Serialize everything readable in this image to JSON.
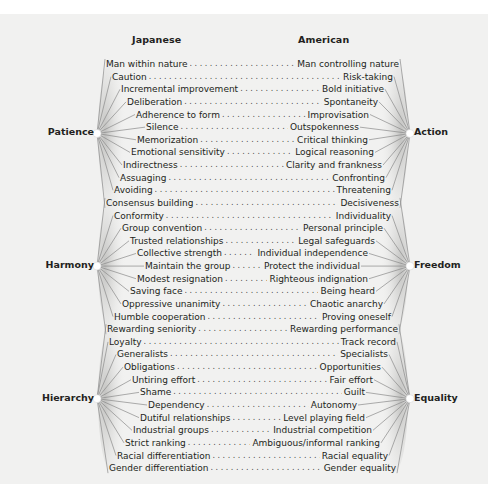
{
  "headers": {
    "left": "Japanese",
    "right": "American"
  },
  "groups": [
    {
      "left": "Patience",
      "right": "Action",
      "rows": [
        0,
        11
      ]
    },
    {
      "left": "Harmony",
      "right": "Freedom",
      "rows": [
        11,
        21
      ]
    },
    {
      "left": "Hierarchy",
      "right": "Equality",
      "rows": [
        21,
        32
      ]
    }
  ],
  "rows": [
    {
      "jp": "Man within nature",
      "us": "Man controlling nature"
    },
    {
      "jp": "Caution",
      "us": "Risk-taking"
    },
    {
      "jp": "Incremental improvement",
      "us": "Bold initiative"
    },
    {
      "jp": "Deliberation",
      "us": "Spontaneity"
    },
    {
      "jp": "Adherence to form",
      "us": "Improvisation"
    },
    {
      "jp": "Silence",
      "us": "Outspokenness"
    },
    {
      "jp": "Memorization",
      "us": "Critical thinking"
    },
    {
      "jp": "Emotional sensitivity",
      "us": "Logical reasoning"
    },
    {
      "jp": "Indirectness",
      "us": "Clarity and frankness"
    },
    {
      "jp": "Assuaging",
      "us": "Confronting"
    },
    {
      "jp": "Avoiding",
      "us": "Threatening"
    },
    {
      "jp": "Consensus building",
      "us": "Decisiveness"
    },
    {
      "jp": "Conformity",
      "us": "Individuality"
    },
    {
      "jp": "Group convention",
      "us": "Personal principle"
    },
    {
      "jp": "Trusted relationships",
      "us": "Legal safeguards"
    },
    {
      "jp": "Collective strength",
      "us": "Individual independence"
    },
    {
      "jp": "Maintain the group",
      "us": "Protect the individual"
    },
    {
      "jp": "Modest resignation",
      "us": "Righteous indignation"
    },
    {
      "jp": "Saving face",
      "us": "Being heard"
    },
    {
      "jp": "Oppressive unanimity",
      "us": "Chaotic anarchy"
    },
    {
      "jp": "Humble cooperation",
      "us": "Proving oneself"
    },
    {
      "jp": "Rewarding seniority",
      "us": "Rewarding performance"
    },
    {
      "jp": "Loyalty",
      "us": "Track record"
    },
    {
      "jp": "Generalists",
      "us": "Specialists"
    },
    {
      "jp": "Obligations",
      "us": "Opportunities"
    },
    {
      "jp": "Untiring effort",
      "us": "Fair effort"
    },
    {
      "jp": "Shame",
      "us": "Guilt"
    },
    {
      "jp": "Dependency",
      "us": "Autonomy"
    },
    {
      "jp": "Dutiful relationships",
      "us": "Level playing field"
    },
    {
      "jp": "Industrial groups",
      "us": "Industrial competition"
    },
    {
      "jp": "Strict ranking",
      "us": "Ambiguous/informal ranking"
    },
    {
      "jp": "Racial differentiation",
      "us": "Racial equality"
    },
    {
      "jp": "Gender differentiation",
      "us": "Gender equality"
    }
  ],
  "layout_hint": {
    "indent": [
      0,
      6,
      15,
      21,
      30,
      40,
      31,
      25,
      17,
      14,
      8,
      0,
      8,
      16,
      24,
      31,
      39,
      31,
      24,
      16,
      8,
      1,
      3,
      11,
      18,
      26,
      34,
      42,
      34,
      27,
      19,
      11,
      3
    ]
  }
}
